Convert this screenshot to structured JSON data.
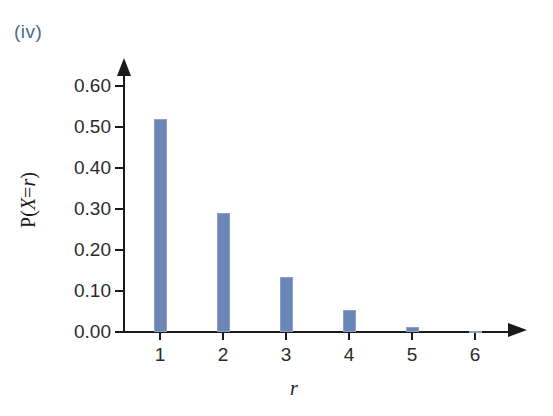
{
  "figure": {
    "part_label": "(iv)",
    "part_label_color": "#4a6a8a"
  },
  "chart_data": {
    "type": "bar",
    "title": "",
    "subtitle": "",
    "xlabel": "r",
    "ylabel": "P(X=r)",
    "ylabel_parts": {
      "prefix": "P(",
      "variable": "X",
      "equals": "=",
      "variable2": "r",
      "suffix": ")"
    },
    "categories": [
      "1",
      "2",
      "3",
      "4",
      "5",
      "6"
    ],
    "values": [
      0.52,
      0.29,
      0.135,
      0.053,
      0.013,
      0.002
    ],
    "bar_color": "#6b86b8",
    "bar_edge_color": "#8c9fc4",
    "xlim": [
      0.5,
      6.5
    ],
    "ylim": [
      0.0,
      0.6
    ],
    "ytick_labels": [
      "0.60",
      "0.50",
      "0.40",
      "0.30",
      "0.20",
      "0.10",
      "0.00"
    ],
    "ytick_values": [
      0.6,
      0.5,
      0.4,
      0.3,
      0.2,
      0.1,
      0.0
    ],
    "xtick_labels": [
      "1",
      "2",
      "3",
      "4",
      "5",
      "6"
    ],
    "grid": false,
    "legend": false,
    "axis_color": "#1a1a1a",
    "axis_arrows": true
  }
}
